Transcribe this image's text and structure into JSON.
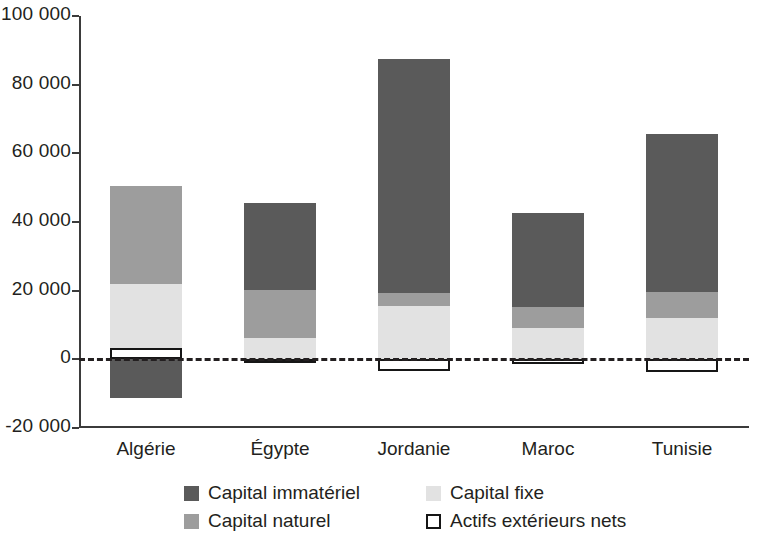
{
  "chart_data": {
    "type": "bar",
    "subtype": "stacked-bar-with-negative",
    "title": "",
    "subtitle": "",
    "xlabel": "",
    "ylabel": "",
    "categories": [
      "Algérie",
      "Égypte",
      "Jordanie",
      "Maroc",
      "Tunisie"
    ],
    "series": [
      {
        "name": "Capital immatériel",
        "color": "#5a5a5a",
        "values": [
          -11400,
          25400,
          68100,
          27500,
          45900
        ]
      },
      {
        "name": "Capital naturel",
        "color": "#9d9d9d",
        "values": [
          28400,
          14000,
          3800,
          6100,
          7600
        ]
      },
      {
        "name": "Capital fixe",
        "color": "#e2e2e2",
        "values": [
          22000,
          6100,
          15500,
          9100,
          12000
        ]
      },
      {
        "name": "Actifs extérieurs nets",
        "color": "#ffffff",
        "values": [
          3400,
          -600,
          -3500,
          -1500,
          -3800
        ]
      }
    ],
    "ylim": [
      -20000,
      100000
    ],
    "yticks": [
      -20000,
      0,
      20000,
      40000,
      60000,
      80000,
      100000
    ],
    "ytick_labels": [
      "-20 000",
      "0",
      "20 000",
      "40 000",
      "60 000",
      "80 000",
      "100 000"
    ],
    "grid": false,
    "zero_line": true,
    "zero_line_style": "dashed",
    "legend_position": "bottom",
    "legend": [
      "Capital immatériel",
      "Capital fixe",
      "Capital naturel",
      "Actifs extérieurs nets"
    ],
    "bar_totals_positive": [
      50000,
      45500,
      87400,
      42700,
      65500
    ]
  },
  "axis": {
    "y_ticks": [
      {
        "label": "100 000",
        "value": 100000
      },
      {
        "label": "80 000",
        "value": 80000
      },
      {
        "label": "60 000",
        "value": 60000
      },
      {
        "label": "40 000",
        "value": 40000
      },
      {
        "label": "20 000",
        "value": 20000
      },
      {
        "label": "0",
        "value": 0
      },
      {
        "label": "-20 000",
        "value": -20000
      }
    ]
  },
  "categories": [
    {
      "label": "Algérie"
    },
    {
      "label": "Égypte"
    },
    {
      "label": "Jordanie"
    },
    {
      "label": "Maroc"
    },
    {
      "label": "Tunisie"
    }
  ],
  "legend": {
    "rows": [
      [
        {
          "label": "Capital immatériel",
          "swatch": "immateriel"
        },
        {
          "label": "Capital fixe",
          "swatch": "fixe"
        }
      ],
      [
        {
          "label": "Capital naturel",
          "swatch": "naturel"
        },
        {
          "label": "Actifs extérieurs nets",
          "swatch": "actifs"
        }
      ]
    ]
  },
  "colors": {
    "capital_immateriel": "#5a5a5a",
    "capital_naturel": "#9d9d9d",
    "capital_fixe": "#e2e2e2",
    "actifs_exterieurs_nets": "#ffffff",
    "axis": "#3b3b3b",
    "text": "#231f20"
  }
}
